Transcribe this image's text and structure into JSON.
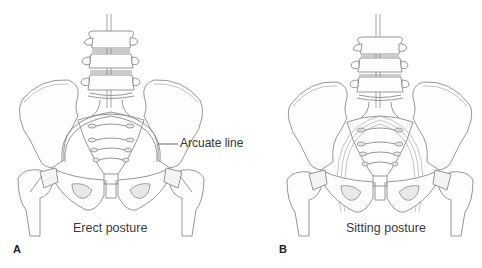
{
  "figure": {
    "panels": [
      {
        "letter": "A",
        "caption": "Erect posture",
        "callout": {
          "label": "Arcuate line"
        }
      },
      {
        "letter": "B",
        "caption": "Sitting posture"
      }
    ]
  },
  "colors": {
    "background": "#ffffff",
    "line_art": "#8a8a8a",
    "text": "#333333"
  }
}
